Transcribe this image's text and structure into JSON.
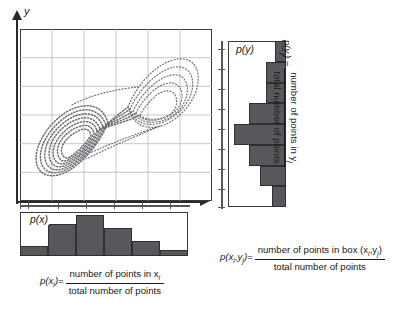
{
  "figure": {
    "axes": {
      "y_label": "y",
      "x_label": ""
    }
  },
  "main_plot": {
    "name": "attractor-scatter",
    "grid_cols": 6,
    "grid_rows": 6,
    "point_color": "#6a6a70",
    "frame_color": "#3a3a3a"
  },
  "py_plot": {
    "label": "p(y)",
    "orientation": "horizontal",
    "bar_color": "#58585c"
  },
  "px_plot": {
    "label": "p(x)",
    "orientation": "vertical",
    "bar_color": "#58585c"
  },
  "formula_x": {
    "lhs": "p(x",
    "lhs_sub": "i",
    "lhs_close": ")=",
    "numerator": "number of points in x",
    "numerator_sub": "i",
    "denominator": "total number of points"
  },
  "formula_y": {
    "lhs": "p(y",
    "lhs_sub": "j",
    "lhs_close": ") =",
    "numerator": "number of points in y",
    "numerator_sub": "j",
    "denominator": "total number of points"
  },
  "formula_xy": {
    "lhs": "p(x",
    "lhs_sub": "i",
    "lhs_mid": ",y",
    "lhs_sub2": "j",
    "lhs_close": ")=",
    "numerator": "number of points in box (x",
    "numerator_sub": "i",
    "numerator_mid": ",y",
    "numerator_sub2": "j",
    "numerator_close": ")",
    "denominator": "total number of points"
  },
  "chart_data": {
    "type": "scatter",
    "title": "",
    "xlabel": "",
    "ylabel": "y",
    "grid": true,
    "py_histogram": {
      "type": "bar",
      "orientation": "horizontal",
      "title": "p(y)",
      "bins": [
        "y1",
        "y2",
        "y3",
        "y4",
        "y5",
        "y6",
        "y7",
        "y8"
      ],
      "values": [
        0.22,
        0.38,
        0.38,
        0.72,
        1.0,
        0.72,
        0.5,
        0.26
      ]
    },
    "px_histogram": {
      "type": "bar",
      "orientation": "vertical",
      "title": "p(x)",
      "bins": [
        "x1",
        "x2",
        "x3",
        "x4",
        "x5",
        "x6"
      ],
      "values": [
        0.22,
        0.72,
        0.92,
        0.62,
        0.34,
        0.14
      ]
    }
  }
}
